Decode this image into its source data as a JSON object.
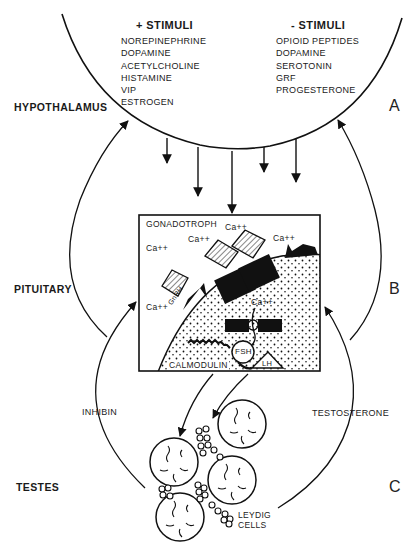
{
  "hypothalamus": {
    "region_label": "HYPOTHALAMUS",
    "panel_letter": "A",
    "positive": {
      "title": "+ STIMULI",
      "items": [
        "NOREPINEPHRINE",
        "DOPAMINE",
        "ACETYLCHOLINE",
        "HISTAMINE",
        "VIP",
        "ESTROGEN"
      ]
    },
    "negative": {
      "title": "- STIMULI",
      "items": [
        "OPIOID PEPTIDES",
        "DOPAMINE",
        "SEROTONIN",
        "GRF",
        "PROGESTERONE"
      ]
    }
  },
  "pituitary": {
    "region_label": "PITUITARY",
    "panel_letter": "B",
    "cell_label": "GONADOTROPH",
    "calcium": [
      "Ca++",
      "Ca++",
      "Ca++",
      "Ca++",
      "Ca++",
      "Ca++"
    ],
    "hormone_label": "GnRH",
    "calmodulin": "CALMODULIN",
    "fsh": "FSH",
    "lh": "LH"
  },
  "testes": {
    "region_label": "TESTES",
    "panel_letter": "C",
    "leydig": [
      "LEYDIG",
      "CELLS"
    ],
    "feedback_left": "INHIBIN",
    "feedback_right": "TESTOSTERONE"
  }
}
